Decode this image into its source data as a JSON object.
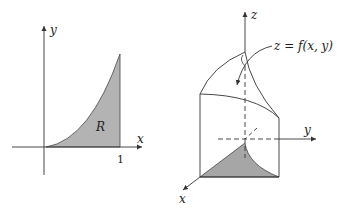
{
  "left_figure": {
    "axis_x_label": "x",
    "axis_y_label": "y",
    "region_label": "R",
    "tick_x_label": "1",
    "region_fill": "#b3b3b3"
  },
  "right_figure": {
    "axis_x_label": "x",
    "axis_y_label": "y",
    "axis_z_label": "z",
    "surface_label": "z = f(x, y)",
    "region_fill": "#a6a6a6"
  }
}
